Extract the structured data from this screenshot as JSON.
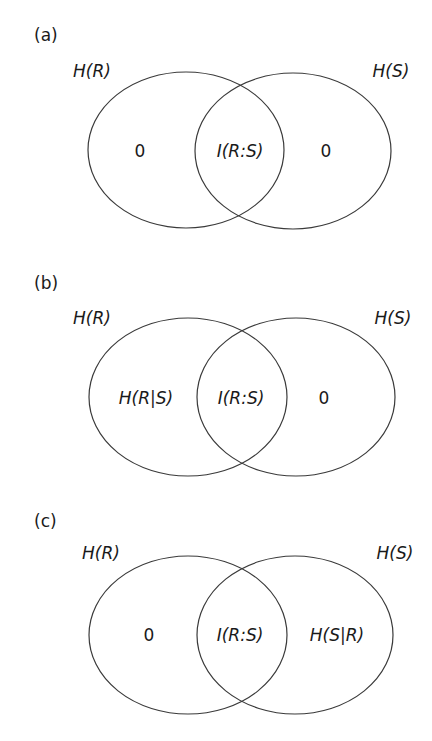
{
  "panels": [
    {
      "id": "a",
      "label": "(a)",
      "set_left": "H(R)",
      "set_right": "H(S)",
      "region_left": "0",
      "region_middle": "I(R:S)",
      "region_right": "0"
    },
    {
      "id": "b",
      "label": "(b)",
      "set_left": "H(R)",
      "set_right": "H(S)",
      "region_left": "H(R|S)",
      "region_middle": "I(R:S)",
      "region_right": "0"
    },
    {
      "id": "c",
      "label": "(c)",
      "set_left": "H(R)",
      "set_right": "H(S)",
      "region_left": "0",
      "region_middle": "I(R:S)",
      "region_right": "H(S|R)"
    }
  ],
  "colors": {
    "stroke": "#3a3a3a",
    "text": "#1a1a1a",
    "background": "#ffffff"
  }
}
